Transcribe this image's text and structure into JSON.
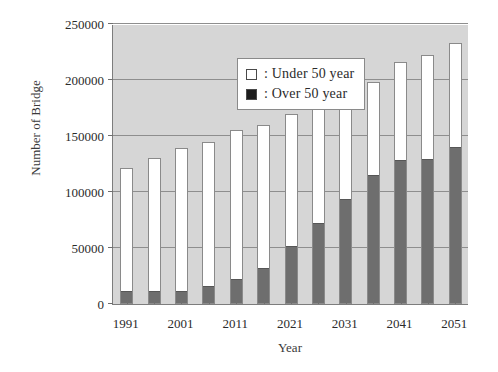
{
  "chart_data": {
    "type": "bar",
    "title": "",
    "xlabel": "Year",
    "ylabel": "Number of Bridge",
    "ylim": [
      0,
      250000
    ],
    "ytick_values": [
      0,
      50000,
      100000,
      150000,
      200000,
      250000
    ],
    "ytick_labels": [
      "0",
      "50000",
      "100000",
      "150000",
      "200000",
      "250000"
    ],
    "grid": true,
    "stacked": true,
    "legend_position": "top-left",
    "categories": [
      "1991",
      "1996",
      "2001",
      "2006",
      "2011",
      "2016",
      "2021",
      "2026",
      "2031",
      "2036",
      "2041",
      "2046",
      "2051"
    ],
    "xtick_labels": [
      "1991",
      "",
      "2001",
      "",
      "2011",
      "",
      "2021",
      "",
      "2031",
      "",
      "2041",
      "",
      "2051"
    ],
    "series": [
      {
        "name": "Over 50 year",
        "color": "#6e6e6e",
        "values": [
          11000,
          11000,
          11000,
          15000,
          21000,
          31000,
          51000,
          71000,
          93000,
          114000,
          128000,
          129000,
          139000
        ]
      },
      {
        "name": "Under 50 year",
        "color": "#ffffff",
        "values": [
          110000,
          119000,
          128000,
          130000,
          134000,
          129000,
          119000,
          108000,
          97000,
          84000,
          88000,
          93000,
          94000
        ]
      }
    ],
    "totals": [
      121000,
      130000,
      139000,
      145000,
      155000,
      160000,
      170000,
      179000,
      190000,
      198000,
      216000,
      222000,
      233000
    ]
  },
  "legend": {
    "items": [
      {
        "marker": "under-50-swatch",
        "label": ": Under 50 year"
      },
      {
        "marker": "over-50-swatch",
        "label": ": Over 50 year"
      }
    ]
  },
  "colors": {
    "plot_background": "#d6d6d6",
    "gridline": "#8e8e8e",
    "axis": "#7d7d7d",
    "bar_over": "#6e6e6e",
    "bar_under": "#ffffff",
    "text": "#2b2b2b"
  }
}
